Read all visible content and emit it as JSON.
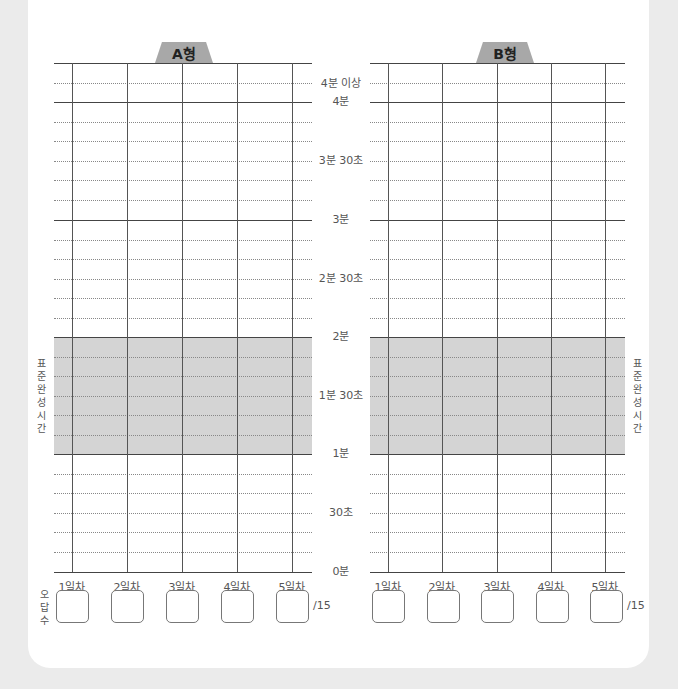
{
  "charts": [
    {
      "id": "A",
      "title": "A형",
      "y_labels": [
        "4분 이상",
        "4분",
        "3분 30초",
        "3분",
        "2분 30초",
        "2분",
        "1분 30초",
        "1분",
        "30초",
        "0분"
      ],
      "days": [
        "1일차",
        "2일차",
        "3일차",
        "4일차",
        "5일차"
      ],
      "wrong_answers": [
        "",
        "",
        "",
        "",
        ""
      ],
      "denominator": "/15"
    },
    {
      "id": "B",
      "title": "B형",
      "days": [
        "1일차",
        "2일차",
        "3일차",
        "4일차",
        "5일차"
      ],
      "wrong_answers": [
        "",
        "",
        "",
        "",
        ""
      ],
      "denominator": "/15"
    }
  ],
  "standard_time_label": "표준완성시간",
  "standard_time_chars": [
    "표",
    "준",
    "완",
    "성",
    "시",
    "간"
  ],
  "wrong_count_chars": [
    "오",
    "답",
    "수"
  ],
  "standard_band": {
    "from": "1분",
    "to": "2분",
    "color": "#d4d4d4"
  },
  "colors": {
    "background": "#ebebeb",
    "card": "#ffffff",
    "tab": "#a8a8a8",
    "band": "#d4d4d4"
  }
}
